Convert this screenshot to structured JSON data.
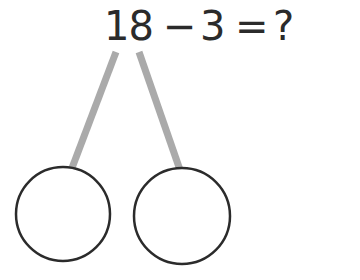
{
  "equation": {
    "minuend": "18",
    "operator": "−",
    "subtrahend": "3",
    "equals": "=",
    "result": "?"
  },
  "number_bond": {
    "whole": "18",
    "parts": [
      "",
      ""
    ]
  },
  "colors": {
    "text": "#2b2b2b",
    "connector": "#aaaaaa",
    "circle_stroke": "#2b2b2b"
  }
}
